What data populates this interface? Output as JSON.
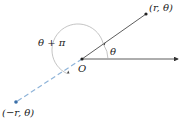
{
  "diagram": {
    "origin": {
      "label": "O",
      "x": 82,
      "y": 59
    },
    "polar_axis": {
      "x1": 82,
      "y1": 59,
      "x2": 178,
      "y2": 59,
      "color": "#333333"
    },
    "ray_r": {
      "x2": 146,
      "y2": 14,
      "color": "#333333"
    },
    "ray_neg_r": {
      "x2": 16,
      "y2": 102,
      "color": "#8fb4d9",
      "style": "dashed"
    },
    "point_r": {
      "label": "(r, θ)",
      "color": "#222222"
    },
    "point_neg_r": {
      "label": "(−r, θ)",
      "color": "#3a6fa8"
    },
    "angle_theta": {
      "label": "θ"
    },
    "angle_theta_plus_pi": {
      "label": "θ + π"
    },
    "arc_color": "#aaaaaa"
  }
}
